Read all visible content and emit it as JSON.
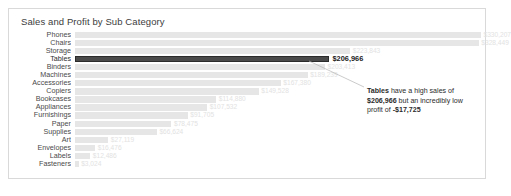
{
  "chart_data": {
    "type": "bar",
    "title": "Sales and Profit by Sub Category",
    "xlabel": "",
    "ylabel": "",
    "orientation": "horizontal",
    "grid": false,
    "legend": "none",
    "xlim": [
      0,
      330207
    ],
    "categories": [
      "Phones",
      "Chairs",
      "Storage",
      "Tables",
      "Binders",
      "Machines",
      "Accessories",
      "Copiers",
      "Bookcases",
      "Appliances",
      "Furnishings",
      "Paper",
      "Supplies",
      "Art",
      "Envelopes",
      "Labels",
      "Fasteners"
    ],
    "values": [
      330207,
      328449,
      223843,
      206966,
      203413,
      189239,
      167380,
      149528,
      114880,
      107532,
      91705,
      78475,
      66624,
      27119,
      16476,
      12486,
      3024
    ],
    "value_labels": [
      "$330,207",
      "$328,449",
      "$223,843",
      "$206,966",
      "$203,413",
      "$189,239",
      "$167,380",
      "$149,528",
      "$114,880",
      "$107,532",
      "$91,705",
      "$78,475",
      "$66,624",
      "$27,119",
      "$16,476",
      "$12,486",
      "$3,024"
    ],
    "highlighted_category": "Tables",
    "colors": {
      "bar": "#e6e6e6",
      "highlight_bar": "#4a4a4a",
      "label": "#e2e2e2",
      "highlight_label": "#1a1a1a"
    }
  },
  "annotation": {
    "lead": "Tables",
    "text_1": " have a high sales of ",
    "value_sales": "$206,966",
    "text_2": " but an incredibly low profit of ",
    "value_profit": "-$17,725"
  }
}
